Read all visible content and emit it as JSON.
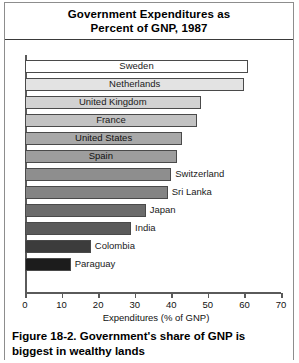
{
  "title": {
    "line1": "Government Expenditures as",
    "line2": "Percent of GNP, 1987"
  },
  "caption": {
    "line1": "Figure 18-2.  Government's share of GNP is",
    "line2": "biggest in wealthy lands"
  },
  "axis": {
    "x_title": "Expenditures (% of GNP)",
    "ticks": [
      "0",
      "10",
      "20",
      "30",
      "40",
      "50",
      "60",
      "70"
    ]
  },
  "chart_data": {
    "type": "bar",
    "orientation": "horizontal",
    "title": "Government Expenditures as Percent of GNP, 1987",
    "xlabel": "Expenditures (% of GNP)",
    "ylabel": "",
    "xlim": [
      0,
      70
    ],
    "xticks": [
      0,
      10,
      20,
      30,
      40,
      50,
      60,
      70
    ],
    "grid": false,
    "legend": false,
    "categories": [
      "Sweden",
      "Netherlands",
      "United Kingdom",
      "France",
      "United States",
      "Spain",
      "Switzerland",
      "Sri Lanka",
      "Japan",
      "India",
      "Colombia",
      "Paraguay"
    ],
    "values": [
      61,
      60,
      48,
      47,
      43,
      41.5,
      40,
      39,
      33,
      29,
      18,
      12.5
    ],
    "label_placement": [
      "inside",
      "inside",
      "inside",
      "inside",
      "inside",
      "inside",
      "outside",
      "outside",
      "outside",
      "outside",
      "outside",
      "outside"
    ],
    "bar_fills": [
      "#ffffff",
      "#e3e3e3",
      "#d2d2d2",
      "#c2c2c2",
      "#a8a8a8",
      "#9d9d9d",
      "#8e8e8e",
      "#848484",
      "#6b6b6b",
      "#5a5a5a",
      "#3c3c3c",
      "#1c1c1c"
    ]
  }
}
